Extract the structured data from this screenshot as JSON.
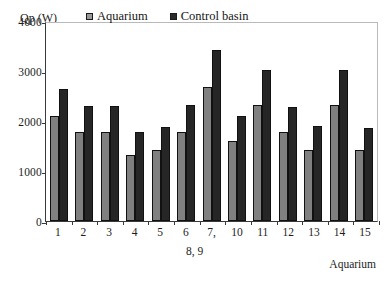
{
  "chart_data": {
    "type": "bar",
    "title": "",
    "subtitle": "",
    "xlabel": "Aquarium",
    "ylabel": "Qp (W)",
    "ylim": [
      0,
      4000
    ],
    "yticks": [
      0,
      1000,
      2000,
      3000,
      4000
    ],
    "ytick_labels": [
      "0",
      "1000",
      "2000",
      "3000",
      "4000"
    ],
    "grid": false,
    "legend_position": "inside-top-center",
    "categories": [
      "1",
      "2",
      "3",
      "4",
      "5",
      "6",
      "7,",
      "10",
      "11",
      "12",
      "13",
      "14",
      "15"
    ],
    "category_wrap_note": "8, 9",
    "series": [
      {
        "name": "Aquarium",
        "color": "#808080",
        "values": [
          2100,
          1780,
          1780,
          1330,
          1420,
          1780,
          2680,
          1600,
          2320,
          1780,
          1420,
          2320,
          1420
        ]
      },
      {
        "name": "Control basin",
        "color": "#262626",
        "values": [
          2640,
          2310,
          2310,
          1780,
          1880,
          2320,
          3420,
          2110,
          3020,
          2290,
          1900,
          3020,
          1870
        ]
      }
    ]
  },
  "legend": {
    "items": [
      {
        "label": "Aquarium",
        "swatch": "legend-swatch-aquarium"
      },
      {
        "label": "Control basin",
        "swatch": "legend-swatch-control-basin"
      }
    ]
  },
  "axes": {
    "y_title": "Qp (W)",
    "x_title": "Aquarium"
  }
}
